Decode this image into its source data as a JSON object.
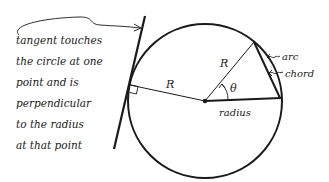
{
  "diagram": {
    "note": {
      "lines": [
        "tangent touches",
        "the circle at one",
        "point and is",
        "perpendicular",
        "to the radius",
        "at that point"
      ]
    },
    "labels": {
      "tangent_radius": "R",
      "angled_radius": "R",
      "angle": "θ",
      "horizontal_radius": "radius",
      "arc": "arc",
      "chord": "chord"
    },
    "colors": {
      "ink": "#1a1a1a",
      "background": "#ffffff"
    }
  }
}
